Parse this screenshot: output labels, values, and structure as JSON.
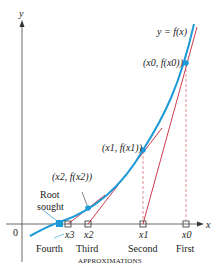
{
  "diagram": {
    "curve_label": "y = f(x)",
    "axis": {
      "x_label": "x",
      "y_label": "y",
      "origin_label": "0"
    },
    "points": [
      {
        "label": "(x0, f(x0))",
        "x_label": "x0",
        "approx": "First"
      },
      {
        "label": "(x1, f(x1))",
        "x_label": "x1",
        "approx": "Second"
      },
      {
        "label": "(x2, f(x2))",
        "x_label": "x2",
        "approx": "Third"
      },
      {
        "label": "",
        "x_label": "x3",
        "approx": "Fourth"
      }
    ],
    "root_label_line1": "Root",
    "root_label_line2": "sought",
    "caption": "APPROXIMATIONS",
    "colors": {
      "curve": "#1e9ad6",
      "tangent": "#c8243a",
      "dash": "#d9707c",
      "axis": "#333333"
    }
  }
}
